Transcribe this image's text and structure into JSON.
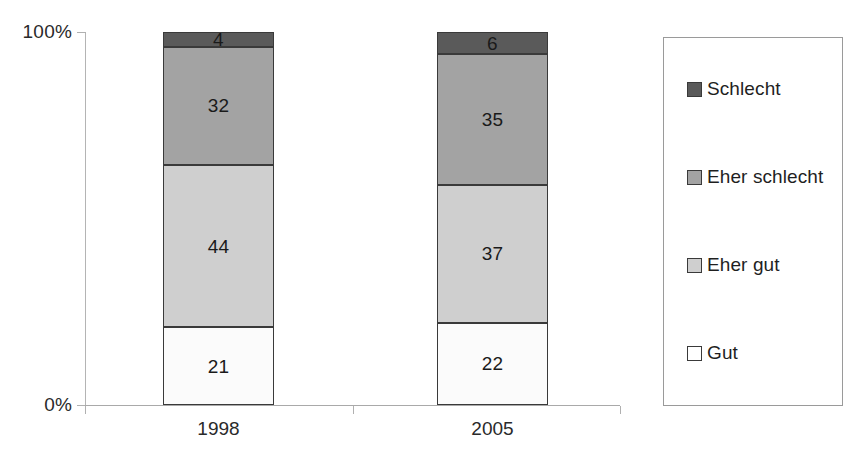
{
  "chart_data": {
    "type": "bar",
    "subtype": "stacked-100-percent",
    "title": "",
    "subtitle": "",
    "xlabel": "",
    "ylabel": "",
    "categories": [
      "1998",
      "2005"
    ],
    "ylim": [
      0,
      100
    ],
    "ytick_labels": [
      "0%",
      "100%"
    ],
    "grid": false,
    "legend_position": "right",
    "stack_order_bottom_to_top": [
      "Gut",
      "Eher gut",
      "Eher schlecht",
      "Schlecht"
    ],
    "series": [
      {
        "name": "Gut",
        "color": "#fbfbfb",
        "values": [
          21,
          22
        ]
      },
      {
        "name": "Eher gut",
        "color": "#cfcfcf",
        "values": [
          44,
          37
        ]
      },
      {
        "name": "Eher schlecht",
        "color": "#a3a3a3",
        "values": [
          32,
          35
        ]
      },
      {
        "name": "Schlecht",
        "color": "#5a5a5a",
        "values": [
          4,
          6
        ]
      }
    ],
    "legend_entries": [
      {
        "label": "Schlecht",
        "color": "#5a5a5a"
      },
      {
        "label": "Eher schlecht",
        "color": "#a3a3a3"
      },
      {
        "label": "Eher gut",
        "color": "#cfcfcf"
      },
      {
        "label": "Gut",
        "color": "#ffffff"
      }
    ],
    "data_labels": {
      "1998": {
        "Schlecht": "4",
        "Eher schlecht": "32",
        "Eher gut": "44",
        "Gut": "21"
      },
      "2005": {
        "Schlecht": "6",
        "Eher schlecht": "35",
        "Eher gut": "37",
        "Gut": "22"
      }
    }
  },
  "axis": {
    "y_top_label": "100%",
    "y_bottom_label": "0%"
  },
  "bars": [
    {
      "category": "1998",
      "segments": [
        {
          "name": "Schlecht",
          "value": "4",
          "color": "#5a5a5a"
        },
        {
          "name": "Eher schlecht",
          "value": "32",
          "color": "#a3a3a3"
        },
        {
          "name": "Eher gut",
          "value": "44",
          "color": "#cfcfcf"
        },
        {
          "name": "Gut",
          "value": "21",
          "color": "#fbfbfb"
        }
      ]
    },
    {
      "category": "2005",
      "segments": [
        {
          "name": "Schlecht",
          "value": "6",
          "color": "#5a5a5a"
        },
        {
          "name": "Eher schlecht",
          "value": "35",
          "color": "#a3a3a3"
        },
        {
          "name": "Eher gut",
          "value": "37",
          "color": "#cfcfcf"
        },
        {
          "name": "Gut",
          "value": "22",
          "color": "#fbfbfb"
        }
      ]
    }
  ],
  "legend": {
    "items": [
      {
        "label": "Schlecht",
        "color": "#5a5a5a"
      },
      {
        "label": "Eher schlecht",
        "color": "#a3a3a3"
      },
      {
        "label": "Eher gut",
        "color": "#cfcfcf"
      },
      {
        "label": "Gut",
        "color": "#ffffff"
      }
    ]
  }
}
